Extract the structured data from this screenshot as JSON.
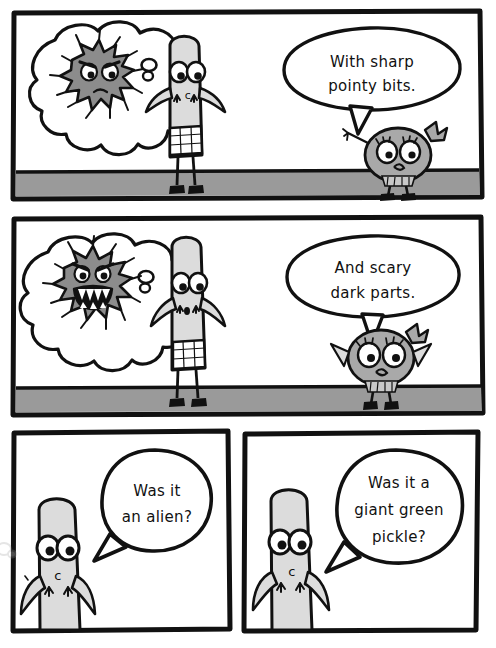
{
  "comic": {
    "title": "Comic strip - four panels",
    "background_color": "#ffffff",
    "ink_color": "#111111",
    "ground_color": "#9a9a9a",
    "character_body_color": "#dcdcdc",
    "monster_color": "#8c8c8c",
    "girl_color": "#a9a9a9",
    "panels": [
      {
        "index": 1,
        "name": "panel-1",
        "thought_cloud": {
          "contains": "angry-blob-monster",
          "monster_expression": "angry-frowning"
        },
        "characters": [
          "capsule-character",
          "girl-character"
        ],
        "speech": {
          "speaker": "girl-character",
          "lines": [
            "With sharp",
            "pointy bits."
          ],
          "text": "With sharp pointy bits."
        }
      },
      {
        "index": 2,
        "name": "panel-2",
        "thought_cloud": {
          "contains": "toothy-blob-monster",
          "monster_expression": "angry-open-mouth-sharp-teeth"
        },
        "characters": [
          "capsule-character",
          "girl-character"
        ],
        "speech": {
          "speaker": "girl-character",
          "lines": [
            "And scary",
            "dark parts."
          ],
          "text": "And scary dark parts."
        }
      },
      {
        "index": 3,
        "name": "panel-3",
        "characters": [
          "capsule-character"
        ],
        "speech": {
          "speaker": "capsule-character",
          "lines": [
            "Was it",
            "an alien?"
          ],
          "text": "Was it an alien?"
        }
      },
      {
        "index": 4,
        "name": "panel-4",
        "characters": [
          "capsule-character"
        ],
        "speech": {
          "speaker": "capsule-character",
          "lines": [
            "Was it a",
            "giant green",
            "pickle?"
          ],
          "text": "Was it a giant green pickle?"
        }
      }
    ],
    "character_marks": {
      "belly_mark": "c"
    }
  }
}
